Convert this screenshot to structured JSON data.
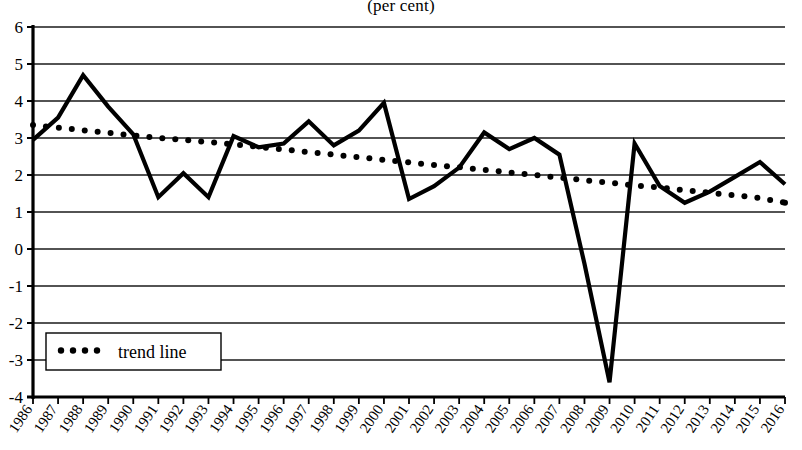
{
  "chart_data": {
    "type": "line",
    "title": "(per cent)",
    "xlabel": "",
    "ylabel": "",
    "ylim": [
      -4,
      6
    ],
    "ytick_step": 1,
    "grid": true,
    "grid_axis": "y",
    "legend_position": "bottom-left",
    "categories": [
      "1986",
      "1987",
      "1988",
      "1989",
      "1990",
      "1991",
      "1992",
      "1993",
      "1994",
      "1995",
      "1996",
      "1997",
      "1998",
      "1999",
      "2000",
      "2001",
      "2002",
      "2003",
      "2004",
      "2005",
      "2006",
      "2007",
      "2008",
      "2009",
      "2010",
      "2011",
      "2012",
      "2013",
      "2014",
      "2015",
      "2016"
    ],
    "yticks": [
      6,
      5,
      4,
      3,
      2,
      1,
      0,
      -1,
      -2,
      -3,
      -4
    ],
    "series": [
      {
        "name": "series",
        "style": "solid",
        "color": "#000000",
        "show_in_legend": false,
        "values": [
          2.95,
          3.55,
          4.7,
          3.85,
          3.1,
          1.4,
          2.05,
          1.4,
          3.05,
          2.75,
          2.85,
          3.45,
          2.8,
          3.2,
          3.95,
          1.35,
          1.7,
          2.2,
          3.15,
          2.7,
          3.0,
          2.55,
          -0.4,
          -3.6,
          2.85,
          1.7,
          1.25,
          1.55,
          1.95,
          2.35,
          1.75
        ]
      },
      {
        "name": "trend line",
        "style": "dotted",
        "color": "#000000",
        "show_in_legend": true,
        "values": [
          3.35,
          3.28,
          3.21,
          3.14,
          3.07,
          3.0,
          2.95,
          2.89,
          2.83,
          2.76,
          2.69,
          2.62,
          2.55,
          2.48,
          2.41,
          2.34,
          2.27,
          2.21,
          2.14,
          2.07,
          2.0,
          1.93,
          1.86,
          1.79,
          1.72,
          1.66,
          1.59,
          1.52,
          1.45,
          1.38,
          1.25
        ]
      }
    ],
    "legend": [
      {
        "label": "trend line",
        "marker": "dotted-line",
        "color": "#000000"
      }
    ],
    "annotations": []
  },
  "geometry": {
    "plot_left": 33,
    "plot_right": 785,
    "plot_top": 27,
    "plot_bottom": 397,
    "x_step": 25.06
  }
}
